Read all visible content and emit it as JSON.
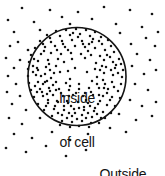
{
  "diagram": {
    "type": "cell-membrane-diffusion",
    "background_color": "#ffffff",
    "ink_color": "#141414",
    "labels": {
      "inside": {
        "line1": "Inside",
        "line2": "of cell"
      },
      "outside": {
        "line1": "Outside",
        "line2": "of cell"
      }
    },
    "cell": {
      "shape": "circle",
      "center_x": 77,
      "center_y": 76.5,
      "radius": 49,
      "stroke_color": "#141414",
      "stroke_width": 1.6,
      "fill_color": "#ffffff"
    },
    "particles": {
      "dot_color": "#141414",
      "dot_radius_inside": 1.25,
      "dot_radius_outside": 1.35,
      "inside_count": 196,
      "outside_count": 60,
      "inside_density_label": "high concentration",
      "outside_density_label": "low concentration",
      "inside_points": [
        [
          56,
          31
        ],
        [
          66,
          30
        ],
        [
          76,
          29
        ],
        [
          86,
          30
        ],
        [
          95,
          32
        ],
        [
          47,
          35
        ],
        [
          60,
          36
        ],
        [
          70,
          35
        ],
        [
          80,
          34
        ],
        [
          90,
          36
        ],
        [
          101,
          37
        ],
        [
          108,
          40
        ],
        [
          40,
          41
        ],
        [
          51,
          42
        ],
        [
          62,
          41
        ],
        [
          72,
          40
        ],
        [
          82,
          41
        ],
        [
          92,
          42
        ],
        [
          102,
          44
        ],
        [
          111,
          46
        ],
        [
          35,
          48
        ],
        [
          45,
          47
        ],
        [
          55,
          46
        ],
        [
          65,
          47
        ],
        [
          75,
          46
        ],
        [
          85,
          47
        ],
        [
          95,
          48
        ],
        [
          105,
          50
        ],
        [
          114,
          52
        ],
        [
          31,
          55
        ],
        [
          41,
          54
        ],
        [
          51,
          53
        ],
        [
          61,
          54
        ],
        [
          71,
          53
        ],
        [
          81,
          54
        ],
        [
          91,
          55
        ],
        [
          100,
          56
        ],
        [
          110,
          57
        ],
        [
          119,
          59
        ],
        [
          29,
          62
        ],
        [
          38,
          61
        ],
        [
          48,
          60
        ],
        [
          58,
          59
        ],
        [
          104,
          60
        ],
        [
          113,
          62
        ],
        [
          121,
          64
        ],
        [
          28,
          69
        ],
        [
          37,
          68
        ],
        [
          46,
          67
        ],
        [
          56,
          66
        ],
        [
          106,
          67
        ],
        [
          115,
          68
        ],
        [
          123,
          70
        ],
        [
          28,
          76
        ],
        [
          36,
          75
        ],
        [
          45,
          74
        ],
        [
          54,
          73
        ],
        [
          104,
          73
        ],
        [
          113,
          75
        ],
        [
          122,
          77
        ],
        [
          29,
          83
        ],
        [
          38,
          82
        ],
        [
          47,
          81
        ],
        [
          56,
          82
        ],
        [
          103,
          80
        ],
        [
          112,
          82
        ],
        [
          121,
          84
        ],
        [
          31,
          90
        ],
        [
          40,
          89
        ],
        [
          49,
          88
        ],
        [
          59,
          89
        ],
        [
          69,
          90
        ],
        [
          79,
          89
        ],
        [
          89,
          88
        ],
        [
          99,
          88
        ],
        [
          108,
          89
        ],
        [
          118,
          91
        ],
        [
          34,
          97
        ],
        [
          43,
          96
        ],
        [
          53,
          95
        ],
        [
          63,
          96
        ],
        [
          73,
          95
        ],
        [
          83,
          96
        ],
        [
          93,
          95
        ],
        [
          103,
          96
        ],
        [
          112,
          97
        ],
        [
          120,
          98
        ],
        [
          38,
          104
        ],
        [
          48,
          103
        ],
        [
          58,
          102
        ],
        [
          68,
          103
        ],
        [
          78,
          102
        ],
        [
          88,
          103
        ],
        [
          98,
          104
        ],
        [
          107,
          105
        ],
        [
          115,
          106
        ],
        [
          44,
          110
        ],
        [
          54,
          109
        ],
        [
          64,
          110
        ],
        [
          74,
          109
        ],
        [
          84,
          110
        ],
        [
          94,
          111
        ],
        [
          103,
          112
        ],
        [
          111,
          113
        ],
        [
          52,
          116
        ],
        [
          62,
          115
        ],
        [
          72,
          116
        ],
        [
          82,
          115
        ],
        [
          92,
          117
        ],
        [
          101,
          118
        ],
        [
          62,
          121
        ],
        [
          72,
          122
        ],
        [
          82,
          121
        ],
        [
          91,
          123
        ],
        [
          50,
          38
        ],
        [
          73,
          33
        ],
        [
          99,
          41
        ],
        [
          44,
          51
        ],
        [
          68,
          50
        ],
        [
          88,
          51
        ],
        [
          34,
          59
        ],
        [
          64,
          62
        ],
        [
          96,
          63
        ],
        [
          33,
          66
        ],
        [
          50,
          70
        ],
        [
          68,
          71
        ],
        [
          95,
          69
        ],
        [
          33,
          72
        ],
        [
          51,
          78
        ],
        [
          70,
          79
        ],
        [
          97,
          77
        ],
        [
          35,
          86
        ],
        [
          53,
          85
        ],
        [
          70,
          86
        ],
        [
          97,
          84
        ],
        [
          42,
          92
        ],
        [
          61,
          93
        ],
        [
          76,
          93
        ],
        [
          91,
          92
        ],
        [
          107,
          93
        ],
        [
          48,
          100
        ],
        [
          67,
          101
        ],
        [
          86,
          100
        ],
        [
          100,
          101
        ],
        [
          55,
          106
        ],
        [
          71,
          106
        ],
        [
          84,
          107
        ],
        [
          95,
          108
        ],
        [
          58,
          113
        ],
        [
          69,
          113
        ],
        [
          88,
          113
        ],
        [
          97,
          114
        ],
        [
          67,
          118
        ],
        [
          77,
          119
        ],
        [
          86,
          118
        ],
        [
          43,
          44
        ],
        [
          57,
          50
        ],
        [
          78,
          37
        ],
        [
          89,
          44
        ],
        [
          107,
          55
        ],
        [
          116,
          65
        ],
        [
          118,
          73
        ],
        [
          114,
          87
        ],
        [
          105,
          84
        ],
        [
          41,
          76
        ],
        [
          43,
          84
        ],
        [
          38,
          70
        ],
        [
          49,
          64
        ],
        [
          63,
          44
        ],
        [
          83,
          44
        ],
        [
          93,
          39
        ],
        [
          72,
          59
        ],
        [
          85,
          58
        ],
        [
          102,
          66
        ],
        [
          111,
          70
        ],
        [
          100,
          70
        ],
        [
          87,
          72
        ],
        [
          75,
          68
        ],
        [
          60,
          72
        ],
        [
          47,
          94
        ],
        [
          57,
          101
        ],
        [
          79,
          108
        ],
        [
          90,
          106
        ],
        [
          75,
          113
        ],
        [
          64,
          106
        ],
        [
          50,
          91
        ],
        [
          66,
          83
        ],
        [
          79,
          84
        ],
        [
          92,
          81
        ],
        [
          104,
          88
        ],
        [
          110,
          100
        ],
        [
          99,
          95
        ],
        [
          85,
          93
        ],
        [
          69,
          96
        ],
        [
          56,
          90
        ],
        [
          45,
          82
        ],
        [
          37,
          92
        ],
        [
          79,
          126
        ],
        [
          70,
          127
        ],
        [
          89,
          127
        ],
        [
          60,
          125
        ],
        [
          99,
          123
        ],
        [
          105,
          118
        ],
        [
          46,
          106
        ]
      ],
      "outside_points": [
        [
          22,
          8
        ],
        [
          50,
          10
        ],
        [
          78,
          12
        ],
        [
          104,
          7
        ],
        [
          130,
          10
        ],
        [
          152,
          14
        ],
        [
          8,
          20
        ],
        [
          34,
          22
        ],
        [
          62,
          17
        ],
        [
          92,
          19
        ],
        [
          116,
          24
        ],
        [
          142,
          27
        ],
        [
          158,
          32
        ],
        [
          14,
          32
        ],
        [
          40,
          30
        ],
        [
          70,
          24
        ],
        [
          120,
          33
        ],
        [
          146,
          38
        ],
        [
          18,
          42
        ],
        [
          10,
          46
        ],
        [
          28,
          50
        ],
        [
          131,
          44
        ],
        [
          155,
          46
        ],
        [
          6,
          58
        ],
        [
          20,
          60
        ],
        [
          14,
          68
        ],
        [
          137,
          54
        ],
        [
          150,
          60
        ],
        [
          8,
          76
        ],
        [
          16,
          84
        ],
        [
          132,
          66
        ],
        [
          144,
          74
        ],
        [
          156,
          70
        ],
        [
          7,
          92
        ],
        [
          20,
          96
        ],
        [
          135,
          84
        ],
        [
          148,
          90
        ],
        [
          12,
          104
        ],
        [
          26,
          110
        ],
        [
          130,
          100
        ],
        [
          142,
          106
        ],
        [
          156,
          102
        ],
        [
          9,
          118
        ],
        [
          22,
          124
        ],
        [
          40,
          118
        ],
        [
          119,
          114
        ],
        [
          136,
          120
        ],
        [
          152,
          116
        ],
        [
          14,
          134
        ],
        [
          32,
          138
        ],
        [
          52,
          132
        ],
        [
          70,
          140
        ],
        [
          88,
          134
        ],
        [
          110,
          128
        ],
        [
          126,
          132
        ],
        [
          6,
          148
        ],
        [
          26,
          152
        ],
        [
          46,
          146
        ],
        [
          66,
          156
        ],
        [
          86,
          150
        ]
      ]
    }
  }
}
